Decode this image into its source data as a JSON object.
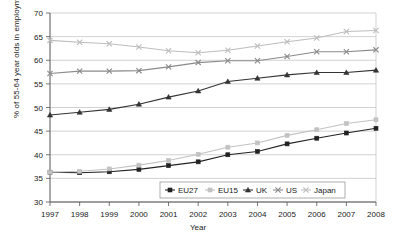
{
  "chart_data": {
    "type": "line",
    "title": "",
    "xlabel": "Year",
    "ylabel": "% of 55-64 year olds in employment",
    "categories": [
      "1997",
      "1998",
      "1999",
      "2000",
      "2001",
      "2002",
      "2003",
      "2004",
      "2005",
      "2006",
      "2007",
      "2008"
    ],
    "x": [
      1997,
      1998,
      1999,
      2000,
      2001,
      2002,
      2003,
      2004,
      2005,
      2006,
      2007,
      2008
    ],
    "xlim": [
      1997,
      2008
    ],
    "ylim": [
      30,
      70
    ],
    "yticks": [
      "30",
      "35",
      "40",
      "45",
      "50",
      "55",
      "60",
      "65",
      "70"
    ],
    "grid": true,
    "legend_position": "bottom-center-inside",
    "series": [
      {
        "name": "EU27",
        "color": "#222222",
        "marker": "square",
        "values": [
          36.3,
          36.2,
          36.4,
          36.9,
          37.7,
          38.5,
          40.0,
          40.7,
          42.3,
          43.5,
          44.6,
          45.6
        ]
      },
      {
        "name": "EU15",
        "color": "#c2c2c2",
        "marker": "square",
        "values": [
          36.3,
          36.5,
          37.0,
          37.8,
          38.8,
          40.1,
          41.6,
          42.5,
          44.1,
          45.3,
          46.6,
          47.4
        ]
      },
      {
        "name": "UK",
        "color": "#333333",
        "marker": "triangle",
        "values": [
          48.4,
          49.0,
          49.6,
          50.7,
          52.2,
          53.5,
          55.5,
          56.2,
          56.9,
          57.4,
          57.4,
          57.9
        ]
      },
      {
        "name": "US",
        "color": "#8a8a8a",
        "marker": "cross",
        "values": [
          57.2,
          57.7,
          57.7,
          57.8,
          58.6,
          59.5,
          59.9,
          59.9,
          60.8,
          61.8,
          61.8,
          62.2
        ]
      },
      {
        "name": "Japan",
        "color": "#bdbdbd",
        "marker": "cross",
        "values": [
          64.2,
          63.8,
          63.5,
          62.8,
          62.0,
          61.6,
          62.1,
          63.0,
          63.9,
          64.7,
          66.1,
          66.3
        ]
      }
    ]
  },
  "legend": {
    "items": [
      {
        "label": "EU27"
      },
      {
        "label": "EU15"
      },
      {
        "label": "UK"
      },
      {
        "label": "US"
      },
      {
        "label": "Japan"
      }
    ]
  },
  "axes": {
    "y_title": "% of 55-64 year olds in employment",
    "x_title": "Year"
  }
}
